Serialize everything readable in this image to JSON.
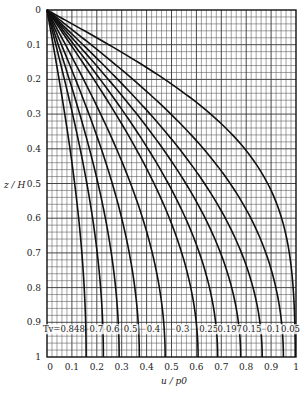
{
  "chart_data": {
    "type": "line",
    "title": "",
    "xlabel": "u / p0",
    "ylabel": "z / H",
    "xlim": [
      0,
      1
    ],
    "ylim": [
      0,
      1
    ],
    "y_inverted": true,
    "grid": true,
    "grid_divisions": 50,
    "x_ticks": [
      "0",
      "0.1",
      "0.2",
      "0.3",
      "0.4",
      "0.5",
      "0.6",
      "0.7",
      "0.8",
      "0.9",
      "1"
    ],
    "y_ticks": [
      "0",
      "0.1",
      "0.2",
      "0.3",
      "0.4",
      "0.5",
      "0.6",
      "0.7",
      "0.8",
      "0.9",
      "1"
    ],
    "legend_prefix": "Tv=",
    "z_samples": [
      0,
      0.1,
      0.2,
      0.3,
      0.4,
      0.5,
      0.6,
      0.7,
      0.8,
      0.9,
      1.0
    ],
    "series": [
      {
        "name": "0.848",
        "Tv": 0.848,
        "values": [
          0,
          0.025,
          0.049,
          0.071,
          0.092,
          0.111,
          0.127,
          0.14,
          0.149,
          0.155,
          0.157
        ]
      },
      {
        "name": "0.7",
        "Tv": 0.7,
        "values": [
          0,
          0.035,
          0.07,
          0.103,
          0.133,
          0.16,
          0.183,
          0.201,
          0.215,
          0.223,
          0.226
        ]
      },
      {
        "name": "0.6",
        "Tv": 0.6,
        "values": [
          0,
          0.045,
          0.09,
          0.132,
          0.17,
          0.205,
          0.235,
          0.258,
          0.276,
          0.287,
          0.29
        ]
      },
      {
        "name": "0.5",
        "Tv": 0.5,
        "values": [
          0,
          0.058,
          0.115,
          0.168,
          0.218,
          0.262,
          0.3,
          0.33,
          0.353,
          0.366,
          0.371
        ]
      },
      {
        "name": "0.4",
        "Tv": 0.4,
        "values": [
          0,
          0.074,
          0.147,
          0.215,
          0.279,
          0.335,
          0.384,
          0.423,
          0.451,
          0.469,
          0.474
        ]
      },
      {
        "name": "0.3",
        "Tv": 0.3,
        "values": [
          0,
          0.095,
          0.187,
          0.275,
          0.356,
          0.428,
          0.49,
          0.54,
          0.577,
          0.599,
          0.607
        ]
      },
      {
        "name": "0.25",
        "Tv": 0.25,
        "values": [
          0,
          0.107,
          0.212,
          0.311,
          0.402,
          0.484,
          0.554,
          0.61,
          0.651,
          0.677,
          0.685
        ]
      },
      {
        "name": "0.197",
        "Tv": 0.197,
        "values": [
          0,
          0.122,
          0.241,
          0.354,
          0.458,
          0.551,
          0.63,
          0.694,
          0.741,
          0.769,
          0.778
        ]
      },
      {
        "name": "0.15",
        "Tv": 0.15,
        "values": [
          0,
          0.138,
          0.273,
          0.4,
          0.516,
          0.618,
          0.704,
          0.773,
          0.824,
          0.855,
          0.865
        ]
      },
      {
        "name": "0.1",
        "Tv": 0.1,
        "values": [
          0,
          0.168,
          0.327,
          0.472,
          0.6,
          0.708,
          0.796,
          0.865,
          0.913,
          0.94,
          0.949
        ]
      },
      {
        "name": "0.05",
        "Tv": 0.05,
        "values": [
          0,
          0.248,
          0.468,
          0.646,
          0.779,
          0.872,
          0.932,
          0.968,
          0.987,
          0.995,
          0.997
        ]
      }
    ],
    "label_y": 0.92
  }
}
